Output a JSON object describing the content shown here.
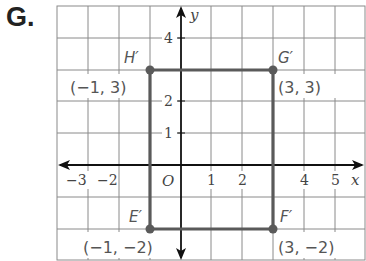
{
  "problem_label": "G.",
  "colors": {
    "grid": "#8a8a8a",
    "axis": "#111111",
    "shape": "#555555",
    "text": "#555555"
  },
  "axes": {
    "x_label": "x",
    "y_label": "y",
    "origin_label": "O",
    "x_ticks": [
      "−3",
      "−2",
      "1",
      "2",
      "4",
      "5"
    ],
    "y_ticks": [
      "4",
      "2",
      "1"
    ]
  },
  "points": [
    {
      "name": "H′",
      "coord": "(−1, 3)"
    },
    {
      "name": "G′",
      "coord": "(3, 3)"
    },
    {
      "name": "E′",
      "coord": "(−1, −2)"
    },
    {
      "name": "F′",
      "coord": "(3, −2)"
    }
  ]
}
